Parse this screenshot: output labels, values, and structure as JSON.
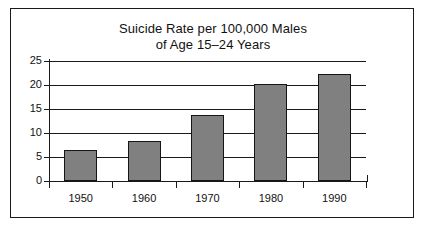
{
  "chart_data": {
    "type": "bar",
    "title": "Suicide Rate per 100,000 Males of Age 15–24 Years",
    "title_lines": [
      "Suicide Rate per 100,000 Males",
      "of Age 15–24 Years"
    ],
    "xlabel": "",
    "ylabel": "",
    "categories": [
      "1950",
      "1960",
      "1970",
      "1980",
      "1990"
    ],
    "values": [
      6.5,
      8.3,
      13.7,
      20.3,
      22.2
    ],
    "ylim": [
      0,
      25
    ],
    "ytick_values": [
      0,
      5,
      10,
      15,
      20,
      25
    ],
    "ytick_labels": [
      "0",
      "5",
      "10",
      "15",
      "20",
      "25"
    ],
    "grid": "horizontal",
    "legend": "none",
    "bar_color": "#808080",
    "bar_edge_color": "#151515",
    "axis_color": "#1a1a1a",
    "background_color": "#ffffff",
    "text_color": "#111111"
  }
}
